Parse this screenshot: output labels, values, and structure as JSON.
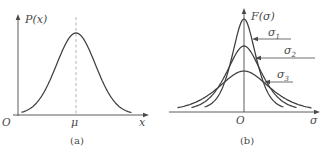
{
  "figure": {
    "background": "#ffffff",
    "curve_color": "#3f3f3f",
    "axis_color": "#4a4a4a",
    "text_color": "#4a4a4a",
    "dash_color": "#b4b4b4"
  },
  "chart_data": [
    {
      "type": "line",
      "title": "",
      "xlabel": "x",
      "ylabel": "P(x)",
      "caption": "(a)",
      "annotations": [
        "O",
        "μ"
      ],
      "description": "Single bell-shaped probability density curve centered at mean μ, marked by a vertical dashed line through the peak.",
      "grid": false
    },
    {
      "type": "line",
      "title": "",
      "xlabel": "σ",
      "ylabel": "F(σ)",
      "caption": "(b)",
      "annotations": [
        "O",
        "σ1",
        "σ2",
        "σ3"
      ],
      "description": "Three bell curves centered at O: σ1 tallest and narrowest, σ2 intermediate, σ3 lowest and widest; arrows point from each label to its curve.",
      "grid": false
    }
  ],
  "panel_a": {
    "caption": "(a)",
    "y_axis_label": "P(x)",
    "x_axis_label": "x",
    "origin_label": "O",
    "mean_label": "μ",
    "axes": {
      "x": {
        "x1": 13,
        "x2": 149,
        "y": 115
      },
      "y": {
        "x": 18,
        "y1": 116,
        "y2": 14
      }
    },
    "dashed_line": {
      "x": 76,
      "y_top": 17,
      "y_bottom": 114
    },
    "curves": [
      {
        "name": "density-curve",
        "center": 76,
        "baseline": 115,
        "amplitude": 82,
        "width": 20,
        "gauss_weight": 0.92,
        "x_start": 22,
        "x_end": 131
      }
    ]
  },
  "panel_b": {
    "caption": "(b)",
    "y_axis_label": "F(σ)",
    "x_axis_label": "σ",
    "origin_label": "O",
    "axes": {
      "x": {
        "x1": 4,
        "x2": 155,
        "y": 112
      },
      "y": {
        "x": 79,
        "y1": 112,
        "y2": 8
      }
    },
    "curves": [
      {
        "name": "curve-sigma-1",
        "label": "σ",
        "sub": "1",
        "center": 79,
        "baseline": 112,
        "amplitude": 93,
        "width": 13,
        "gauss_weight": 0.5,
        "x_start": 40,
        "x_end": 118,
        "leader": {
          "x_tip": 87,
          "x_end": 126,
          "y": 39
        }
      },
      {
        "name": "curve-sigma-2",
        "label": "σ",
        "sub": "2",
        "center": 79,
        "baseline": 112,
        "amplitude": 66,
        "width": 19,
        "gauss_weight": 0.5,
        "x_start": 27,
        "x_end": 131,
        "leader": {
          "x_tip": 90,
          "x_end": 150,
          "y": 58
        }
      },
      {
        "name": "curve-sigma-3",
        "label": "σ",
        "sub": "3",
        "center": 79,
        "baseline": 112,
        "amplitude": 41,
        "width": 28,
        "gauss_weight": 0.5,
        "x_start": 13,
        "x_end": 146,
        "leader": {
          "x_tip": 99,
          "x_end": 128,
          "y": 82
        }
      }
    ]
  }
}
